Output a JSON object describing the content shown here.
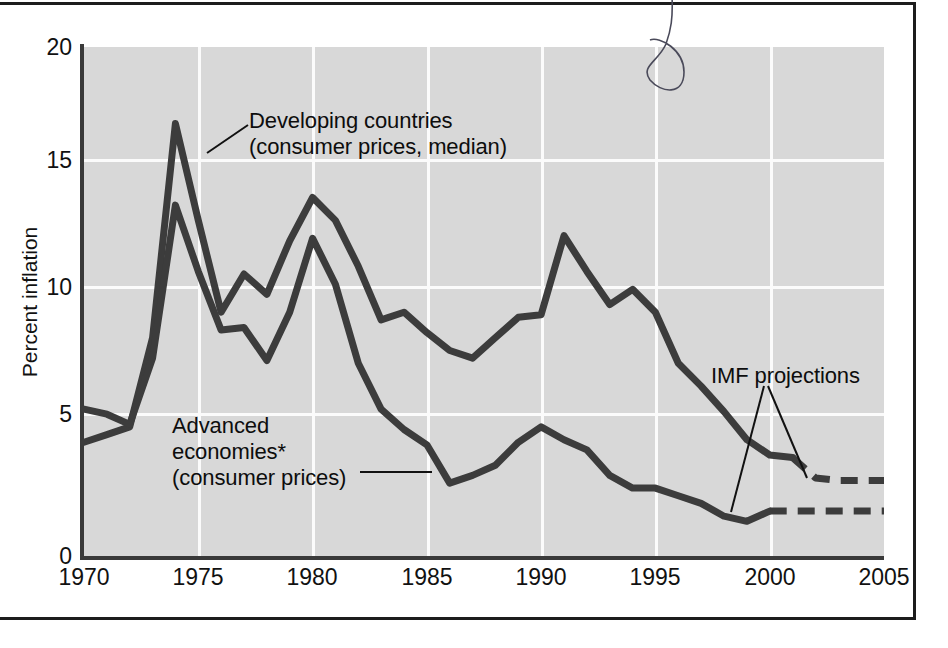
{
  "chart_data": {
    "type": "line",
    "title": "",
    "xlabel": "",
    "ylabel": "Percent inflation",
    "xlim": [
      1970,
      2005
    ],
    "ylim": [
      0,
      20
    ],
    "ytick_labels": [
      "0",
      "5",
      "10",
      "15",
      "20"
    ],
    "ytick_values": [
      0,
      5,
      10,
      15,
      20
    ],
    "xtick_labels": [
      "1970",
      "1975",
      "1980",
      "1985",
      "1990",
      "1995",
      "2000",
      "2005"
    ],
    "xtick_values": [
      1970,
      1975,
      1980,
      1985,
      1990,
      1995,
      2000,
      2005
    ],
    "grid": true,
    "legend": "inline-annotations",
    "x": [
      1970,
      1971,
      1972,
      1973,
      1974,
      1975,
      1976,
      1977,
      1978,
      1979,
      1980,
      1981,
      1982,
      1983,
      1984,
      1985,
      1986,
      1987,
      1988,
      1989,
      1990,
      1991,
      1992,
      1993,
      1994,
      1995,
      1996,
      1997,
      1998,
      1999,
      2000,
      2001,
      2002,
      2003,
      2004,
      2005
    ],
    "series": [
      {
        "name": "Developing countries (consumer prices, median)",
        "color": "#3c3c3c",
        "values": [
          4.5,
          4.8,
          5.1,
          8.6,
          17.0,
          13.2,
          9.6,
          11.1,
          10.3,
          12.4,
          14.1,
          13.2,
          11.4,
          9.3,
          9.6,
          8.8,
          8.1,
          7.8,
          8.6,
          9.4,
          9.5,
          12.6,
          11.2,
          9.9,
          10.5,
          9.6,
          7.6,
          6.7,
          5.7,
          4.6,
          4.0,
          3.9,
          3.1,
          3.0,
          3.0,
          3.0
        ],
        "projection_from": 2001,
        "projection_value": 3.0
      },
      {
        "name": "Advanced economies* (consumer prices)",
        "color": "#3c3c3c",
        "values": [
          5.8,
          5.6,
          5.2,
          7.8,
          13.8,
          11.2,
          8.9,
          9.0,
          7.7,
          9.6,
          12.5,
          10.7,
          7.6,
          5.8,
          5.0,
          4.4,
          2.9,
          3.2,
          3.6,
          4.5,
          5.1,
          4.6,
          4.2,
          3.2,
          2.7,
          2.7,
          2.4,
          2.1,
          1.6,
          1.4,
          1.8,
          1.8,
          1.8,
          1.8,
          1.8,
          1.8
        ],
        "projection_from": 2000,
        "projection_value": 1.8
      }
    ],
    "annotations": [
      {
        "id": "developing",
        "text": "Developing countries\n(consumer prices, median)",
        "leader": true
      },
      {
        "id": "advanced",
        "text": "Advanced\neconomies*\n(consumer prices)",
        "leader": true
      },
      {
        "id": "imf",
        "text": "IMF projections",
        "leader": true
      }
    ]
  },
  "axes": {
    "y_label": "Percent inflation",
    "y_ticks": [
      "20",
      "15",
      "10",
      "5",
      "0"
    ],
    "x_ticks": [
      "1970",
      "1975",
      "1980",
      "1985",
      "1990",
      "1995",
      "2000",
      "2005"
    ]
  },
  "labels": {
    "developing": "Developing countries\n(consumer prices, median)",
    "advanced": "Advanced\neconomies*\n(consumer prices)",
    "imf": "IMF projections"
  },
  "colors": {
    "plot_background": "#d8d8d8",
    "grid": "#fbfbfb",
    "line": "#3c3c3c",
    "axis": "#3a3a3a",
    "text": "#0d0d0d",
    "page": "#ffffff"
  }
}
